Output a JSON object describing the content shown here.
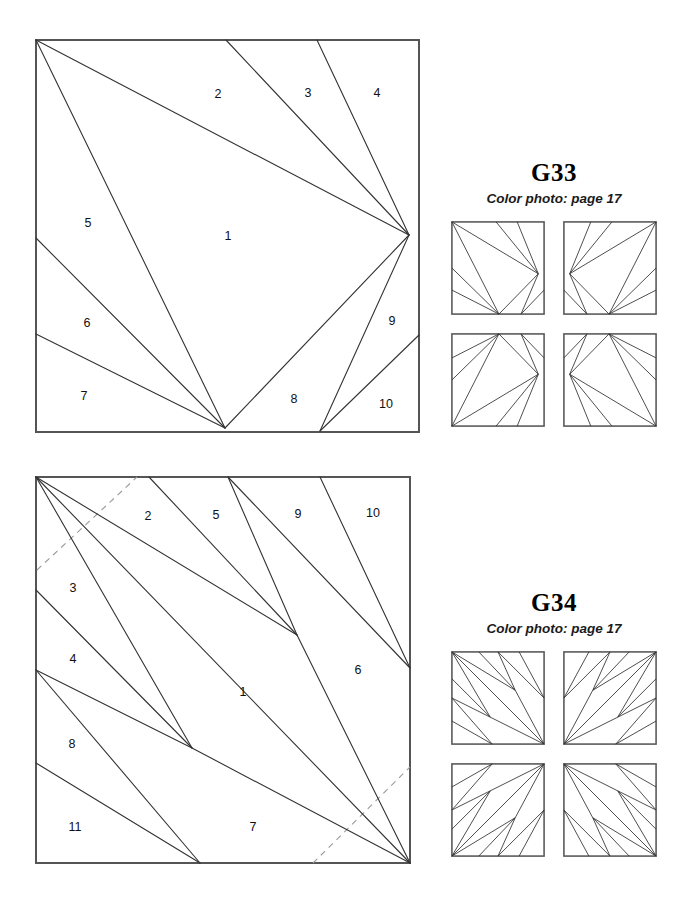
{
  "page": {
    "background": "#ffffff",
    "ink": "#333333",
    "frame_color": "#555555",
    "dashed_color": "#9a9a9a"
  },
  "blocks": [
    {
      "id": "g33",
      "name": "G33",
      "piece_numbers": [
        "1",
        "2",
        "3",
        "4",
        "5",
        "6",
        "7",
        "8",
        "9",
        "10"
      ],
      "piece_count": 10,
      "has_dashed_guides": false,
      "piece_labels": [
        {
          "n": "1",
          "x": 228,
          "y": 237
        },
        {
          "n": "2",
          "x": 218,
          "y": 95
        },
        {
          "n": "3",
          "x": 308,
          "y": 94
        },
        {
          "n": "4",
          "x": 377,
          "y": 94
        },
        {
          "n": "5",
          "x": 88,
          "y": 224
        },
        {
          "n": "6",
          "x": 87,
          "y": 324
        },
        {
          "n": "7",
          "x": 84,
          "y": 397
        },
        {
          "n": "8",
          "x": 294,
          "y": 400
        },
        {
          "n": "9",
          "x": 392,
          "y": 322
        },
        {
          "n": "10",
          "x": 386,
          "y": 405
        }
      ],
      "seams": [
        "M36,40 L409,235",
        "M36,40 L225,428",
        "M226,40 L409,235",
        "M317,40 L409,235",
        "M36,238 L225,428",
        "M36,334 L225,428",
        "M225,428 L409,235",
        "M320,431 L409,235",
        "M320,431 L419,335"
      ],
      "dashed": []
    },
    {
      "id": "g34",
      "name": "G34",
      "piece_numbers": [
        "1",
        "2",
        "3",
        "4",
        "5",
        "6",
        "7",
        "8",
        "9",
        "10",
        "11"
      ],
      "piece_count": 11,
      "has_dashed_guides": true,
      "piece_labels": [
        {
          "n": "1",
          "x": 243,
          "y": 693
        },
        {
          "n": "2",
          "x": 148,
          "y": 517
        },
        {
          "n": "3",
          "x": 73,
          "y": 589
        },
        {
          "n": "4",
          "x": 73,
          "y": 660
        },
        {
          "n": "5",
          "x": 216,
          "y": 516
        },
        {
          "n": "6",
          "x": 358,
          "y": 671
        },
        {
          "n": "7",
          "x": 253,
          "y": 828
        },
        {
          "n": "8",
          "x": 72,
          "y": 745
        },
        {
          "n": "9",
          "x": 298,
          "y": 515
        },
        {
          "n": "10",
          "x": 373,
          "y": 514
        },
        {
          "n": "11",
          "x": 75,
          "y": 828
        }
      ],
      "seams": [
        "M36,477 L297,635",
        "M36,477 L192,748",
        "M36,477 L410,863",
        "M149,477 L297,635",
        "M228,477 L297,635",
        "M228,477 L410,668",
        "M297,635 L410,863",
        "M320,477 L410,668",
        "M36,590 L192,748",
        "M36,670 L192,748",
        "M36,670 L200,863",
        "M36,763 L200,863",
        "M192,748 L410,863"
      ],
      "dashed": [
        "M37,570 L137,477",
        "M313,863 L410,767"
      ]
    }
  ],
  "panels": [
    {
      "id": "g33-panel",
      "title": "G33",
      "subtitle": "Color photo: page 17",
      "layout_label": "four-block rotational setting"
    },
    {
      "id": "g34-panel",
      "title": "G34",
      "subtitle": "Color photo: page 17",
      "layout_label": "four-block rotational setting"
    }
  ],
  "mini_patterns": {
    "g33": {
      "viewbox": "0 0 100 100",
      "variants": [
        [
          "M2,2 L92,56",
          "M2,2 L51,98",
          "M48,2 L92,56",
          "M70,2 L92,56",
          "M2,50 L51,98",
          "M2,73 L51,98",
          "M51,98 L92,56",
          "M74,98 L92,56",
          "M74,98 L98,73"
        ],
        [
          "M98,2 L8,56",
          "M98,2 L49,98",
          "M52,2 L8,56",
          "M30,2 L8,56",
          "M98,50 L49,98",
          "M98,73 L49,98",
          "M49,98 L8,56",
          "M26,98 L8,56",
          "M26,98 L2,73"
        ],
        [
          "M2,98 L92,44",
          "M2,98 L51,2",
          "M48,98 L92,44",
          "M70,98 L92,44",
          "M2,50 L51,2",
          "M2,27 L51,2",
          "M51,2 L92,44",
          "M74,2 L92,44",
          "M74,2 L98,27"
        ],
        [
          "M98,98 L8,44",
          "M98,98 L49,2",
          "M52,98 L8,44",
          "M30,98 L8,44",
          "M98,50 L49,2",
          "M98,27 L49,2",
          "M49,2 L8,44",
          "M26,2 L8,44",
          "M26,2 L2,27"
        ]
      ]
    },
    "g34": {
      "viewbox": "0 0 100 100",
      "variants": [
        [
          "M2,2 L68,42",
          "M2,2 L42,70",
          "M2,2 L98,98",
          "M30,2 L68,42",
          "M50,2 L68,42",
          "M50,2 L98,50",
          "M68,42 L98,98",
          "M72,2 L98,50",
          "M2,30 L42,70",
          "M2,50 L42,70",
          "M2,50 L44,98",
          "M2,74 L44,98",
          "M42,70 L98,98"
        ],
        [
          "M98,2 L32,42",
          "M98,2 L58,70",
          "M98,2 L2,98",
          "M70,2 L32,42",
          "M50,2 L32,42",
          "M50,2 L2,50",
          "M32,42 L2,98",
          "M28,2 L2,50",
          "M98,30 L58,70",
          "M98,50 L58,70",
          "M98,50 L56,98",
          "M98,74 L56,98",
          "M58,70 L2,98"
        ],
        [
          "M2,98 L68,58",
          "M2,98 L42,30",
          "M2,98 L98,2",
          "M30,98 L68,58",
          "M50,98 L68,58",
          "M50,98 L98,50",
          "M68,58 L98,2",
          "M72,98 L98,50",
          "M2,70 L42,30",
          "M2,50 L42,30",
          "M2,50 L44,2",
          "M2,26 L44,2",
          "M42,30 L98,2"
        ],
        [
          "M98,98 L32,58",
          "M98,98 L58,30",
          "M98,98 L2,2",
          "M70,98 L32,58",
          "M50,98 L32,58",
          "M50,98 L2,50",
          "M32,58 L2,2",
          "M28,98 L2,50",
          "M98,70 L58,30",
          "M98,50 L58,30",
          "M98,50 L56,2",
          "M98,26 L56,2",
          "M58,30 L2,2"
        ]
      ]
    }
  }
}
